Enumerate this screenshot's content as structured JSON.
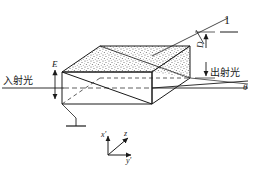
{
  "figure": {
    "type": "optics-diagram",
    "background_color": "#ffffff",
    "line_color": "#1a1a1a",
    "stipple_color": "#4a4a4a"
  },
  "labels": {
    "incident_light": "入射光",
    "emergent_light": "出射光",
    "field_E": "E",
    "dimension_D": "D",
    "angle_theta": "θ",
    "electrode_one": "1"
  },
  "axes": {
    "x_prime": "x'",
    "y_prime": "y'",
    "z": "z"
  },
  "geometry": {
    "prism_front_top_left": [
      62,
      72
    ],
    "prism_front_top_right": [
      152,
      72
    ],
    "prism_front_bottom_left": [
      62,
      104
    ],
    "prism_front_bottom_right": [
      152,
      104
    ],
    "prism_back_top_left": [
      100,
      46
    ],
    "prism_back_top_right": [
      190,
      46
    ],
    "prism_back_bottom_right": [
      190,
      78
    ],
    "diagonal_plane": "internal stippled wedge from front-top-left to back-bottom-right",
    "incident_ray_y": 88,
    "emergent_ray_end": [
      248,
      84
    ]
  }
}
